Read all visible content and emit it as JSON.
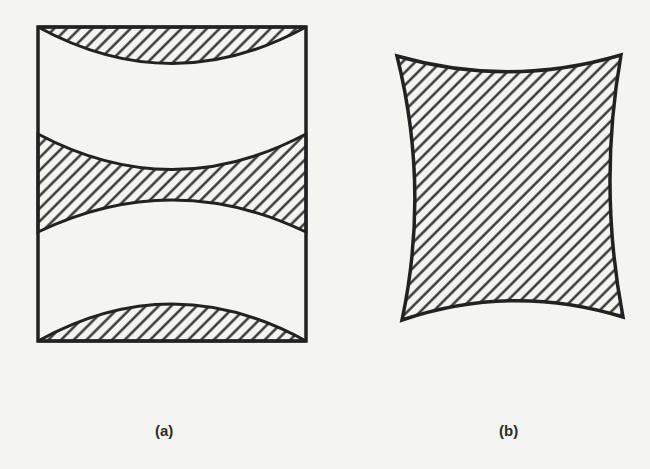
{
  "figure": {
    "panels": [
      {
        "id": "a",
        "label": "(a)",
        "description": "Rectangular frame with three hatched regions: a concave lens at top, a concave-concave band in middle, a convex lens at bottom"
      },
      {
        "id": "b",
        "label": "(b)",
        "description": "Hatched quadrilateral with all four sides curved inward (pincushion shape)"
      }
    ]
  },
  "colors": {
    "background": "#f4f4f2",
    "stroke": "#222222",
    "hatch": "#2a2a2a"
  }
}
